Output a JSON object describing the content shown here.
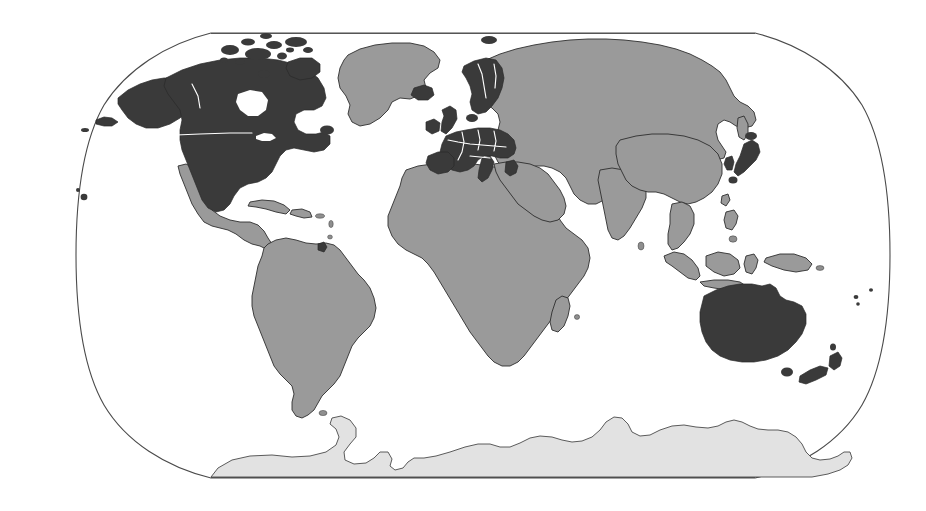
{
  "map": {
    "title": "World Map",
    "projection": "Robinson",
    "background_color": "#ffffff",
    "frame": {
      "stroke_color": "#4a4a4a",
      "top_line_y": 33,
      "bottom_line_y": 478,
      "left_extent_x": 48,
      "right_extent_x": 890
    },
    "legend": {
      "highlight_color": "#3a3a3a",
      "base_color": "#9a9a9a",
      "antarctica_color": "#e2e2e2",
      "border_color": "#ffffff",
      "highlight_label": "Highlighted countries",
      "base_label": "Other countries",
      "antarctica_label": "Antarctica"
    },
    "highlighted_regions": [
      "United States",
      "Canada",
      "Alaska",
      "Iceland",
      "Ireland",
      "United Kingdom",
      "Norway",
      "Sweden",
      "Finland",
      "Denmark",
      "Netherlands",
      "Belgium",
      "Luxembourg",
      "France",
      "Germany",
      "Switzerland",
      "Austria",
      "Italy",
      "Spain",
      "Portugal",
      "Greece",
      "Czech Republic",
      "Slovakia",
      "Hungary",
      "Poland",
      "Slovenia",
      "Japan",
      "South Korea",
      "Australia",
      "New Zealand",
      "French Guiana"
    ],
    "base_regions": [
      "Greenland",
      "Mexico",
      "Central America",
      "Caribbean",
      "South America",
      "Africa",
      "Russia",
      "Eastern Europe",
      "Turkey",
      "Middle East",
      "Central Asia",
      "China",
      "India",
      "Southeast Asia",
      "Indonesia",
      "Papua New Guinea"
    ],
    "antarctica_region": "Antarctica"
  }
}
